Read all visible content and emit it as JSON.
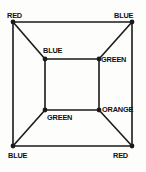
{
  "figure": {
    "canvas": {
      "width": 146,
      "height": 172
    },
    "background_color": "#fdfdfb",
    "line_color": "#1a1a1a",
    "text_color": "#101010",
    "line_width": 1.6,
    "vertex_dot_radius": 2.4,
    "outer_square": {
      "name": "outer-square",
      "corners": [
        {
          "id": "outer-top-left",
          "x": 13,
          "y": 22
        },
        {
          "id": "outer-top-right",
          "x": 132,
          "y": 22
        },
        {
          "id": "outer-bottom-right",
          "x": 132,
          "y": 146
        },
        {
          "id": "outer-bottom-left",
          "x": 13,
          "y": 146
        }
      ]
    },
    "inner_square": {
      "name": "inner-square",
      "corners": [
        {
          "id": "inner-top-left",
          "x": 45,
          "y": 59
        },
        {
          "id": "inner-top-right",
          "x": 99,
          "y": 59
        },
        {
          "id": "inner-bottom-right",
          "x": 99,
          "y": 110
        },
        {
          "id": "inner-bottom-left",
          "x": 45,
          "y": 110
        }
      ]
    },
    "diagonals": [
      {
        "id": "diagonal-top-left",
        "from": "outer-top-left",
        "to": "inner-top-left",
        "x1": 13,
        "y1": 22,
        "x2": 45,
        "y2": 59
      },
      {
        "id": "diagonal-top-right",
        "from": "outer-top-right",
        "to": "inner-top-right",
        "x1": 132,
        "y1": 22,
        "x2": 99,
        "y2": 59
      },
      {
        "id": "diagonal-bottom-right",
        "from": "outer-bottom-right",
        "to": "inner-bottom-right",
        "x1": 132,
        "y1": 146,
        "x2": 99,
        "y2": 110
      },
      {
        "id": "diagonal-bottom-left",
        "from": "outer-bottom-left",
        "to": "inner-bottom-left",
        "x1": 13,
        "y1": 146,
        "x2": 45,
        "y2": 110
      }
    ],
    "labels": [
      {
        "id": "label-outer-top-left",
        "text": "RED",
        "x": 7,
        "y": 11,
        "vertex": "outer-top-left"
      },
      {
        "id": "label-outer-top-right",
        "text": "BLUE",
        "x": 114,
        "y": 11,
        "vertex": "outer-top-right"
      },
      {
        "id": "label-inner-top-left",
        "text": "BLUE",
        "x": 43,
        "y": 46,
        "vertex": "inner-top-left"
      },
      {
        "id": "label-inner-top-right",
        "text": "GREEN",
        "x": 101,
        "y": 55,
        "vertex": "inner-top-right"
      },
      {
        "id": "label-inner-bottom-right",
        "text": "ORANGE",
        "x": 102,
        "y": 105,
        "vertex": "inner-bottom-right"
      },
      {
        "id": "label-inner-bottom-left",
        "text": "GREEN",
        "x": 47,
        "y": 113,
        "vertex": "inner-bottom-left"
      },
      {
        "id": "label-outer-bottom-left",
        "text": "BLUE",
        "x": 8,
        "y": 151,
        "vertex": "outer-bottom-left"
      },
      {
        "id": "label-outer-bottom-right",
        "text": "RED",
        "x": 113,
        "y": 151,
        "vertex": "outer-bottom-right"
      }
    ]
  }
}
